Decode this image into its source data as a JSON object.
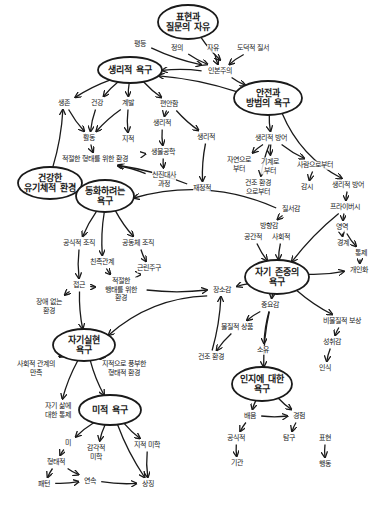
{
  "diagram": {
    "title": "",
    "ellipse_nodes": [
      {
        "id": "free",
        "text": "표현과\n질문의 자유",
        "x": 188,
        "y": 22,
        "rx": 30,
        "ry": 17
      },
      {
        "id": "physio",
        "text": "생리적 욕구",
        "x": 130,
        "y": 70,
        "rx": 32,
        "ry": 13
      },
      {
        "id": "safety",
        "text": "안전과\n방범의 욕구",
        "x": 268,
        "y": 98,
        "rx": 34,
        "ry": 17
      },
      {
        "id": "healthy",
        "text": "건강한\n유기체적 환경",
        "x": 50,
        "y": 183,
        "rx": 32,
        "ry": 16
      },
      {
        "id": "belong",
        "text": "동화하려는\n욕구",
        "x": 105,
        "y": 196,
        "rx": 29,
        "ry": 16
      },
      {
        "id": "esteem",
        "text": "자기 존중의\n욕구",
        "x": 277,
        "y": 277,
        "rx": 32,
        "ry": 17
      },
      {
        "id": "selfact",
        "text": "자기실현\n욕구",
        "x": 84,
        "y": 345,
        "rx": 31,
        "ry": 16
      },
      {
        "id": "cognitive",
        "text": "인지에 대한\n욕구",
        "x": 262,
        "y": 384,
        "rx": 30,
        "ry": 17
      },
      {
        "id": "aesthetic",
        "text": "미적 욕구",
        "x": 110,
        "y": 410,
        "rx": 31,
        "ry": 15
      }
    ],
    "text_nodes": [
      {
        "id": "equality",
        "text": "평등",
        "x": 140,
        "y": 44
      },
      {
        "id": "justice",
        "text": "정의",
        "x": 177,
        "y": 48
      },
      {
        "id": "freedom",
        "text": "자유",
        "x": 213,
        "y": 48
      },
      {
        "id": "moral",
        "text": "도덕적 질서",
        "x": 253,
        "y": 48
      },
      {
        "id": "humanism",
        "text": "인본주의",
        "x": 220,
        "y": 71
      },
      {
        "id": "survival",
        "text": "생존",
        "x": 64,
        "y": 103
      },
      {
        "id": "health",
        "text": "건강",
        "x": 97,
        "y": 103
      },
      {
        "id": "growth",
        "text": "계발",
        "x": 128,
        "y": 103
      },
      {
        "id": "comfort",
        "text": "편안함",
        "x": 169,
        "y": 104
      },
      {
        "id": "physio2",
        "text": "생리적",
        "x": 162,
        "y": 123
      },
      {
        "id": "physio3",
        "text": "생리적",
        "x": 206,
        "y": 137
      },
      {
        "id": "activity",
        "text": "활동",
        "x": 89,
        "y": 138
      },
      {
        "id": "intellect",
        "text": "지적",
        "x": 128,
        "y": 139
      },
      {
        "id": "bio",
        "text": "생물공학",
        "x": 163,
        "y": 152
      },
      {
        "id": "proper_env",
        "text": "적절한 형태를 위한 환경",
        "x": 95,
        "y": 159
      },
      {
        "id": "metabolism",
        "text": "신진대사\n과정",
        "x": 164,
        "y": 179
      },
      {
        "id": "fiscal",
        "text": "재정적",
        "x": 202,
        "y": 188
      },
      {
        "id": "phys_def",
        "text": "생리적 방어",
        "x": 271,
        "y": 138
      },
      {
        "id": "from_nature",
        "text": "자연으로\n부터",
        "x": 239,
        "y": 164
      },
      {
        "id": "from_machine",
        "text": "기계로\n부터",
        "x": 270,
        "y": 166
      },
      {
        "id": "from_people",
        "text": "사람으로부터",
        "x": 315,
        "y": 165
      },
      {
        "id": "from_built",
        "text": "건조 환경\n으로부터",
        "x": 258,
        "y": 187
      },
      {
        "id": "watch",
        "text": "감시",
        "x": 307,
        "y": 187
      },
      {
        "id": "phys_def2",
        "text": "생리적 방어",
        "x": 348,
        "y": 185
      },
      {
        "id": "privacy",
        "text": "프라이버시",
        "x": 345,
        "y": 207
      },
      {
        "id": "order",
        "text": "질서감",
        "x": 291,
        "y": 209
      },
      {
        "id": "direction",
        "text": "방향감",
        "x": 269,
        "y": 226
      },
      {
        "id": "spatial",
        "text": "공간적",
        "x": 253,
        "y": 237
      },
      {
        "id": "social",
        "text": "사회적",
        "x": 281,
        "y": 237
      },
      {
        "id": "territory",
        "text": "영역",
        "x": 342,
        "y": 227
      },
      {
        "id": "boundary",
        "text": "경계",
        "x": 343,
        "y": 243
      },
      {
        "id": "control",
        "text": "통제",
        "x": 361,
        "y": 253
      },
      {
        "id": "personal",
        "text": "개인화",
        "x": 359,
        "y": 270
      },
      {
        "id": "formal_org",
        "text": "공식적 조직",
        "x": 79,
        "y": 243
      },
      {
        "id": "community",
        "text": "공동체 조직",
        "x": 138,
        "y": 243
      },
      {
        "id": "kinship",
        "text": "친족관계",
        "x": 102,
        "y": 262
      },
      {
        "id": "neighbor",
        "text": "근린주구",
        "x": 149,
        "y": 268
      },
      {
        "id": "access",
        "text": "접근",
        "x": 79,
        "y": 285
      },
      {
        "id": "proper_env2",
        "text": "적절한\n행태를 위한\n환경",
        "x": 121,
        "y": 290
      },
      {
        "id": "barrier_free",
        "text": "장애 없는\n환경",
        "x": 49,
        "y": 306
      },
      {
        "id": "place",
        "text": "장소감",
        "x": 222,
        "y": 290
      },
      {
        "id": "importance",
        "text": "중요감",
        "x": 270,
        "y": 305
      },
      {
        "id": "material",
        "text": "물질적 상품",
        "x": 237,
        "y": 327
      },
      {
        "id": "possession",
        "text": "소유",
        "x": 263,
        "y": 350
      },
      {
        "id": "built_env",
        "text": "건조 환경",
        "x": 211,
        "y": 357
      },
      {
        "id": "nonmaterial",
        "text": "비물질적 보상",
        "x": 342,
        "y": 321
      },
      {
        "id": "achievement",
        "text": "성취감",
        "x": 332,
        "y": 342
      },
      {
        "id": "recognition",
        "text": "인식",
        "x": 325,
        "y": 368
      },
      {
        "id": "social_rel",
        "text": "사회적 관계의\n만족",
        "x": 36,
        "y": 368
      },
      {
        "id": "intellect_env",
        "text": "지적으로 풍부한\n형태적 환경",
        "x": 124,
        "y": 368
      },
      {
        "id": "self_control",
        "text": "자기 삶에\n대한 통제",
        "x": 58,
        "y": 410
      },
      {
        "id": "learning",
        "text": "배움",
        "x": 250,
        "y": 416
      },
      {
        "id": "experience",
        "text": "경험",
        "x": 299,
        "y": 416
      },
      {
        "id": "formal",
        "text": "공식적",
        "x": 236,
        "y": 438
      },
      {
        "id": "explore",
        "text": "탐구",
        "x": 289,
        "y": 438
      },
      {
        "id": "expression",
        "text": "표현",
        "x": 325,
        "y": 438
      },
      {
        "id": "institution",
        "text": "기관",
        "x": 237,
        "y": 463
      },
      {
        "id": "behavior",
        "text": "행동",
        "x": 325,
        "y": 464
      },
      {
        "id": "beauty",
        "text": "미",
        "x": 68,
        "y": 443
      },
      {
        "id": "sensory",
        "text": "감각적\n미학",
        "x": 96,
        "y": 452
      },
      {
        "id": "formal_aes",
        "text": "형태적",
        "x": 56,
        "y": 462
      },
      {
        "id": "cognitive_aes",
        "text": "지적 미학",
        "x": 147,
        "y": 445
      },
      {
        "id": "pattern",
        "text": "패턴",
        "x": 44,
        "y": 484
      },
      {
        "id": "order_seq",
        "text": "연속",
        "x": 90,
        "y": 481
      },
      {
        "id": "symbol",
        "text": "상징",
        "x": 148,
        "y": 484
      }
    ],
    "edges": [
      [
        "free",
        "humanism_top"
      ],
      [
        "equality",
        "humanism"
      ],
      [
        "justice",
        "humanism"
      ],
      [
        "freedom",
        "humanism"
      ],
      [
        "moral",
        "humanism"
      ],
      [
        "humanism",
        "physio"
      ],
      [
        "humanism",
        "safety"
      ],
      [
        "safety",
        "physio"
      ],
      [
        "physio",
        "survival"
      ],
      [
        "physio",
        "health"
      ],
      [
        "physio",
        "growth"
      ],
      [
        "physio",
        "comfort"
      ],
      [
        "survival",
        "activity"
      ],
      [
        "health",
        "activity"
      ],
      [
        "growth",
        "activity"
      ],
      [
        "growth",
        "intellect"
      ],
      [
        "comfort",
        "physio2"
      ],
      [
        "comfort",
        "physio3"
      ],
      [
        "physio2",
        "bio"
      ],
      [
        "bio",
        "metabolism"
      ],
      [
        "activity",
        "proper_env"
      ],
      [
        "bio",
        "proper_env"
      ],
      [
        "metabolism",
        "proper_env"
      ],
      [
        "physio3",
        "fiscal"
      ],
      [
        "safety",
        "phys_def"
      ],
      [
        "safety",
        "phys_def2"
      ],
      [
        "phys_def",
        "from_nature"
      ],
      [
        "phys_def",
        "from_machine"
      ],
      [
        "phys_def",
        "from_built"
      ],
      [
        "phys_def",
        "from_people"
      ],
      [
        "from_people",
        "watch"
      ],
      [
        "phys_def2",
        "privacy"
      ],
      [
        "privacy",
        "territory"
      ],
      [
        "privacy",
        "esteem"
      ],
      [
        "territory",
        "boundary"
      ],
      [
        "territory",
        "control"
      ],
      [
        "control",
        "personal"
      ],
      [
        "order",
        "direction"
      ],
      [
        "order",
        "belong"
      ],
      [
        "spatial",
        "esteem"
      ],
      [
        "social",
        "esteem"
      ],
      [
        "esteem",
        "personal"
      ],
      [
        "esteem",
        "place"
      ],
      [
        "esteem",
        "importance"
      ],
      [
        "esteem",
        "nonmaterial"
      ],
      [
        "importance",
        "material"
      ],
      [
        "importance",
        "possession"
      ],
      [
        "importance",
        "cognitive"
      ],
      [
        "nonmaterial",
        "achievement"
      ],
      [
        "achievement",
        "recognition"
      ],
      [
        "belong",
        "formal_org"
      ],
      [
        "belong",
        "community"
      ],
      [
        "belong",
        "kinship"
      ],
      [
        "community",
        "neighbor"
      ],
      [
        "neighbor",
        "proper_env2"
      ],
      [
        "kinship",
        "proper_env2"
      ],
      [
        "formal_org",
        "access"
      ],
      [
        "access",
        "barrier_free"
      ],
      [
        "access",
        "proper_env2"
      ],
      [
        "access",
        "selfact"
      ],
      [
        "proper_env2",
        "place"
      ],
      [
        "place",
        "selfact"
      ],
      [
        "built_env",
        "place"
      ],
      [
        "material",
        "built_env"
      ],
      [
        "selfact",
        "social_rel"
      ],
      [
        "selfact",
        "self_control"
      ],
      [
        "selfact",
        "aesthetic"
      ],
      [
        "selfact",
        "intellect_env"
      ],
      [
        "cognitive",
        "learning"
      ],
      [
        "cognitive",
        "experience"
      ],
      [
        "learning",
        "experience"
      ],
      [
        "learning",
        "formal"
      ],
      [
        "formal",
        "institution"
      ],
      [
        "experience",
        "explore"
      ],
      [
        "expression",
        "behavior"
      ],
      [
        "aesthetic",
        "beauty"
      ],
      [
        "aesthetic",
        "sensory"
      ],
      [
        "aesthetic",
        "cognitive_aes"
      ],
      [
        "aesthetic",
        "symbol"
      ],
      [
        "beauty",
        "formal_aes"
      ],
      [
        "formal_aes",
        "pattern"
      ],
      [
        "formal_aes",
        "order_seq"
      ],
      [
        "pattern",
        "order_seq"
      ],
      [
        "order_seq",
        "symbol"
      ],
      [
        "cognitive_aes",
        "symbol"
      ],
      [
        "fiscal",
        "proper_env"
      ],
      [
        "healthy",
        "survival"
      ]
    ]
  }
}
